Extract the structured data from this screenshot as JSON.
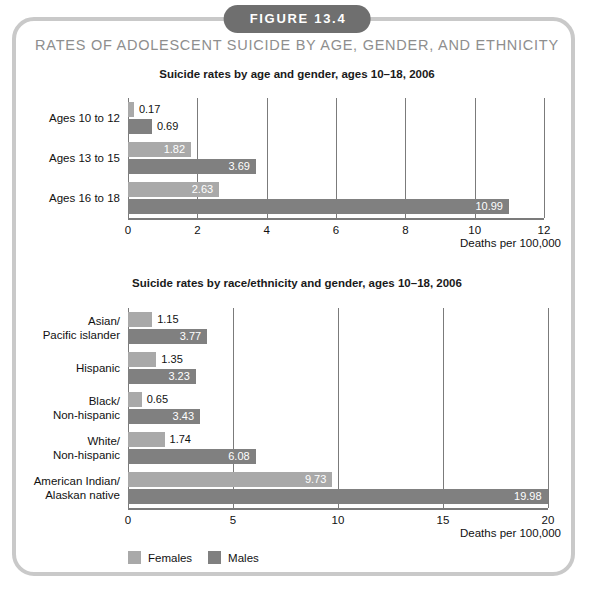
{
  "figure": {
    "badge": "FIGURE 13.4",
    "title": "RATES OF ADOLESCENT SUICIDE BY AGE, GENDER, AND ETHNICITY",
    "badge_color": "#6f6f6f",
    "title_color": "#8e8e8e",
    "frame_color": "#c9c9c9"
  },
  "legend": {
    "items": [
      {
        "label": "Females",
        "color": "#a9a9a9"
      },
      {
        "label": "Males",
        "color": "#808080"
      }
    ]
  },
  "chart_data": [
    {
      "type": "bar",
      "orientation": "horizontal",
      "title": "Suicide rates by age and gender, ages 10–18, 2006",
      "xlabel": "Deaths per 100,000",
      "ylabel": "",
      "categories": [
        "Ages 10 to 12",
        "Ages 13 to 15",
        "Ages 16 to 18"
      ],
      "series": [
        {
          "name": "Females",
          "color": "#a9a9a9",
          "values": [
            0.17,
            1.82,
            2.63
          ]
        },
        {
          "name": "Males",
          "color": "#808080",
          "values": [
            0.69,
            3.69,
            10.99
          ]
        }
      ],
      "xlim": [
        0,
        12
      ],
      "xticks": [
        0,
        2,
        4,
        6,
        8,
        10,
        12
      ],
      "grid": true,
      "legend_position": "bottom"
    },
    {
      "type": "bar",
      "orientation": "horizontal",
      "title": "Suicide rates by race/ethnicity and gender, ages 10–18, 2006",
      "xlabel": "Deaths per 100,000",
      "ylabel": "",
      "categories": [
        "Asian/\nPacific islander",
        "Hispanic",
        "Black/\nNon-hispanic",
        "White/\nNon-hispanic",
        "American Indian/\nAlaskan native"
      ],
      "series": [
        {
          "name": "Females",
          "color": "#a9a9a9",
          "values": [
            1.15,
            1.35,
            0.65,
            1.74,
            9.73
          ]
        },
        {
          "name": "Males",
          "color": "#808080",
          "values": [
            3.77,
            3.23,
            3.43,
            6.08,
            19.98
          ]
        }
      ],
      "xlim": [
        0,
        20
      ],
      "xticks": [
        0,
        5,
        10,
        15,
        20
      ],
      "grid": true,
      "legend_position": "bottom"
    }
  ]
}
